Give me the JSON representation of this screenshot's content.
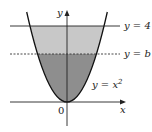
{
  "figure": {
    "axes": {
      "x_label": "x",
      "y_label": "y",
      "origin_label": "0"
    },
    "curve": {
      "label": "y = x²",
      "label_base": "y = x",
      "label_exp": "2"
    },
    "lines": [
      {
        "label": "y = 4",
        "style": "solid"
      },
      {
        "label": "y = b",
        "style": "dashed"
      }
    ],
    "regions": [
      {
        "name": "between y=b and y=4",
        "color": "#c8c8c8"
      },
      {
        "name": "between parabola and y=b",
        "color": "#8e8e8e"
      }
    ]
  }
}
